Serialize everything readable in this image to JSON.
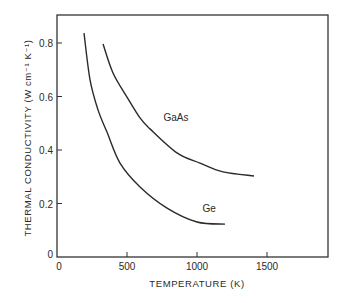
{
  "chart_data": {
    "type": "line",
    "title": "",
    "xlabel": "TEMPERATURE (K)",
    "ylabel": "THERMAL CONDUCTIVITY (W cm⁻¹ K⁻¹)",
    "xlim": [
      0,
      1936
    ],
    "ylim": [
      0,
      0.905
    ],
    "x_ticks": [
      0,
      500,
      1000,
      1500
    ],
    "x_tick_labels": [
      "0",
      "500",
      "1000",
      "1500"
    ],
    "y_ticks": [
      0,
      0.2,
      0.4,
      0.6,
      0.8
    ],
    "y_tick_labels": [
      "0",
      "0.2",
      "0.4",
      "0.6",
      "0.8"
    ],
    "grid": false,
    "legend": "inline labels next to curves",
    "series": [
      {
        "name": "GaAs",
        "label_pos": {
          "x": 760,
          "y": 0.51
        },
        "x": [
          329,
          400,
          500,
          593,
          664,
          857,
          1021,
          1186,
          1407
        ],
        "y": [
          0.796,
          0.688,
          0.598,
          0.52,
          0.479,
          0.389,
          0.351,
          0.318,
          0.303
        ]
      },
      {
        "name": "Ge",
        "label_pos": {
          "x": 1040,
          "y": 0.17
        },
        "x": [
          193,
          236,
          293,
          357,
          450,
          593,
          786,
          1000,
          1200
        ],
        "y": [
          0.837,
          0.662,
          0.55,
          0.467,
          0.351,
          0.262,
          0.183,
          0.131,
          0.123
        ]
      }
    ]
  }
}
